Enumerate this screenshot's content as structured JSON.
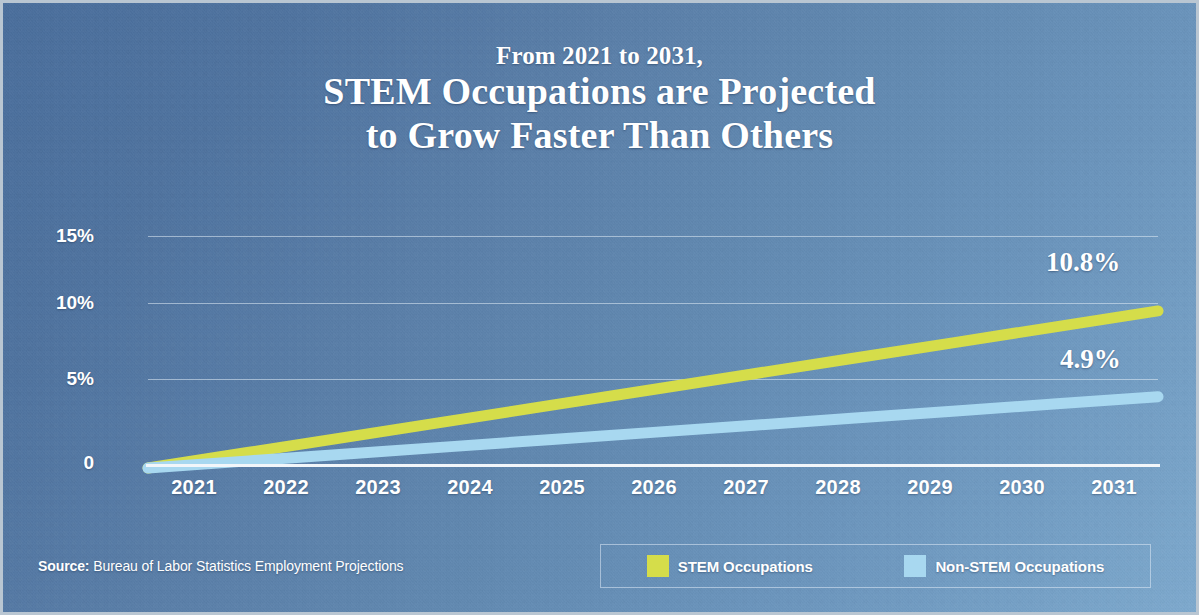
{
  "theme": {
    "background_top_left": "#4a6e9c",
    "background_bottom_right": "#7eaace",
    "text_color": "#ffffff",
    "gridline_color": "#e2ecf6",
    "stem_color": "#d5dd4a",
    "nonstem_color": "#a8d8f0"
  },
  "title": {
    "kicker": "From 2021 to 2031,",
    "line1": "STEM Occupations are Projected",
    "line2": "to Grow Faster Than Others"
  },
  "source": {
    "label": "Source:",
    "text": " Bureau of Labor Statistics Employment Projections"
  },
  "legend": {
    "items": [
      {
        "label": "STEM Occupations",
        "color": "#d5dd4a",
        "swatch_name": "legend-swatch-stem"
      },
      {
        "label": "Non-STEM Occupations",
        "color": "#a8d8f0",
        "swatch_name": "legend-swatch-nonstem"
      }
    ]
  },
  "chart_data": {
    "type": "line",
    "title": "From 2021 to 2031, STEM Occupations are Projected to Grow Faster Than Others",
    "xlabel": "",
    "ylabel": "",
    "x": [
      2021,
      2022,
      2023,
      2024,
      2025,
      2026,
      2027,
      2028,
      2029,
      2030,
      2031
    ],
    "categories": [
      "2021",
      "2022",
      "2023",
      "2024",
      "2025",
      "2026",
      "2027",
      "2028",
      "2029",
      "2030",
      "2031"
    ],
    "ylim": [
      0,
      16.5
    ],
    "ytick_values": [
      0,
      5,
      10,
      15
    ],
    "ytick_labels": [
      "0",
      "5%",
      "10%",
      "15%"
    ],
    "grid": true,
    "grid_axis": "y",
    "legend_position": "bottom-right",
    "series": [
      {
        "name": "STEM Occupations",
        "color": "#d5dd4a",
        "values": [
          0,
          1.08,
          2.16,
          3.24,
          4.32,
          5.4,
          6.48,
          7.56,
          8.64,
          9.72,
          10.8
        ],
        "end_label": "10.8%"
      },
      {
        "name": "Non-STEM Occupations",
        "color": "#a8d8f0",
        "values": [
          0,
          0.49,
          0.98,
          1.47,
          1.96,
          2.45,
          2.94,
          3.43,
          3.92,
          4.41,
          4.9
        ],
        "end_label": "4.9%"
      }
    ],
    "annotations": [
      {
        "text": "10.8%",
        "series": "STEM Occupations",
        "at_x": 2031
      },
      {
        "text": "4.9%",
        "series": "Non-STEM Occupations",
        "at_x": 2031
      }
    ]
  }
}
